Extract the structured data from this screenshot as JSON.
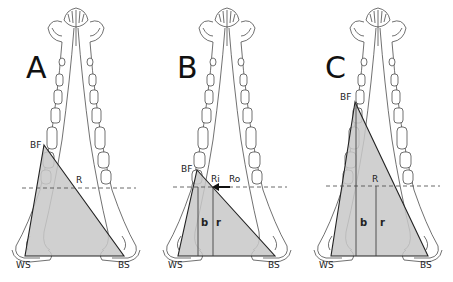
{
  "figure": {
    "colors": {
      "triangle_fill": "#c8c8c8",
      "line": "#222222",
      "outline": "#333333",
      "background": "#ffffff"
    },
    "panels": [
      {
        "id": "A",
        "letter": "A",
        "labels": {
          "bite_point": "BF",
          "resultant": "R",
          "working_side": "WS",
          "balancing_side": "BS"
        }
      },
      {
        "id": "B",
        "letter": "B",
        "labels": {
          "bite_point": "BF",
          "resultant_inner": "Ri",
          "resultant_outer": "Ro",
          "lever_b": "b",
          "lever_r": "r",
          "working_side": "WS",
          "balancing_side": "BS"
        }
      },
      {
        "id": "C",
        "letter": "C",
        "labels": {
          "bite_point": "BF",
          "resultant": "R",
          "lever_b": "b",
          "lever_r": "r",
          "working_side": "WS",
          "balancing_side": "BS"
        }
      }
    ]
  }
}
